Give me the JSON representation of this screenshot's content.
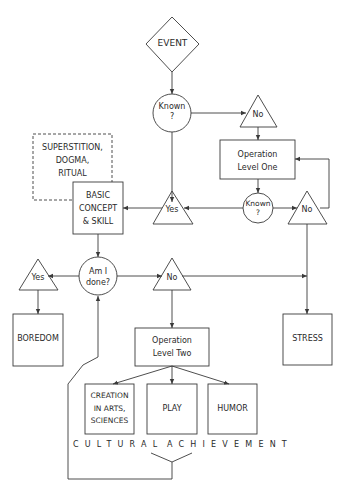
{
  "diagram": {
    "colors": {
      "stroke": "#3a3a3a",
      "text": "#2a2a2a",
      "background": "#ffffff"
    },
    "nodes": {
      "event": {
        "shape": "diamond",
        "label": "EVENT"
      },
      "known_1": {
        "shape": "circle",
        "label_line1": "Known",
        "label_line2": "?"
      },
      "no_1": {
        "shape": "triangle",
        "label": "No"
      },
      "operation_level_one": {
        "shape": "box",
        "label_line1": "Operation",
        "label_line2": "Level One"
      },
      "known_2": {
        "shape": "circle",
        "label_line1": "Known",
        "label_line2": "?"
      },
      "no_2": {
        "shape": "triangle",
        "label": "No"
      },
      "yes_1": {
        "shape": "triangle",
        "label": "Yes"
      },
      "superstition": {
        "shape": "dashed-box",
        "label_line1": "SUPERSTITION,",
        "label_line2": "DOGMA,",
        "label_line3": "RITUAL"
      },
      "basic_concept": {
        "shape": "box",
        "label_line1": "BASIC",
        "label_line2": "CONCEPT",
        "label_line3": "& SKILL"
      },
      "am_i_done": {
        "shape": "circle",
        "label_line1": "Am I",
        "label_line2": "done?"
      },
      "yes_2": {
        "shape": "triangle",
        "label": "Yes"
      },
      "no_3": {
        "shape": "triangle",
        "label": "No"
      },
      "boredom": {
        "shape": "box",
        "label": "BOREDOM"
      },
      "stress": {
        "shape": "box",
        "label": "STRESS"
      },
      "operation_level_two": {
        "shape": "box",
        "label_line1": "Operation",
        "label_line2": "Level Two"
      },
      "creation": {
        "shape": "box",
        "label_line1": "CREATION",
        "label_line2": "IN ARTS,",
        "label_line3": "SCIENCES"
      },
      "play": {
        "shape": "box",
        "label": "PLAY"
      },
      "humor": {
        "shape": "box",
        "label": "HUMOR"
      }
    },
    "group_label": {
      "word1": "CULTURAL",
      "word2": "ACHIEVEMENT"
    },
    "edges": [
      [
        "event",
        "known_1"
      ],
      [
        "known_1",
        "no_1"
      ],
      [
        "known_1",
        "yes_1"
      ],
      [
        "no_1",
        "operation_level_one"
      ],
      [
        "operation_level_one",
        "known_2"
      ],
      [
        "known_2",
        "yes_1"
      ],
      [
        "known_2",
        "no_2"
      ],
      [
        "no_2",
        "operation_level_one"
      ],
      [
        "no_2",
        "stress"
      ],
      [
        "yes_1",
        "basic_concept"
      ],
      [
        "basic_concept",
        "am_i_done"
      ],
      [
        "am_i_done",
        "yes_2"
      ],
      [
        "am_i_done",
        "no_3"
      ],
      [
        "yes_2",
        "boredom"
      ],
      [
        "no_3",
        "stress"
      ],
      [
        "no_3",
        "operation_level_two"
      ],
      [
        "operation_level_two",
        "creation"
      ],
      [
        "operation_level_two",
        "play"
      ],
      [
        "operation_level_two",
        "humor"
      ],
      [
        "cultural_achievement",
        "am_i_done"
      ]
    ]
  }
}
